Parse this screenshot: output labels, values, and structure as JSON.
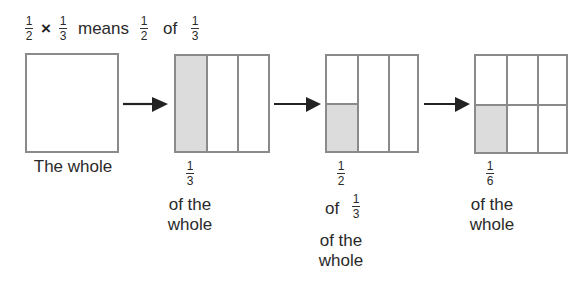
{
  "title": {
    "frac_a": {
      "num": "1",
      "den": "2"
    },
    "operator": "×",
    "frac_b": {
      "num": "1",
      "den": "3"
    },
    "word_means": "means",
    "frac_c": {
      "num": "1",
      "den": "2"
    },
    "word_of": "of",
    "frac_d": {
      "num": "1",
      "den": "3"
    }
  },
  "colors": {
    "border": "#8a8a8a",
    "shade": "#dcdcdc",
    "arrow": "#222222",
    "text": "#2a2a2a"
  },
  "panels": [
    {
      "id": "whole",
      "label_lines": [
        "The whole"
      ],
      "columns": 1,
      "rows": 1,
      "shaded": []
    },
    {
      "id": "one-third",
      "fraction": {
        "num": "1",
        "den": "3"
      },
      "label_lines": [
        "of the",
        "whole"
      ],
      "columns": 3,
      "rows": 1,
      "shaded": [
        "col1"
      ]
    },
    {
      "id": "half-of-third",
      "fraction": {
        "num": "1",
        "den": "2"
      },
      "of_text": "of",
      "inner_fraction": {
        "num": "1",
        "den": "3"
      },
      "label_lines": [
        "of the",
        "whole"
      ],
      "columns": 3,
      "rows": 2,
      "split_column": 1,
      "shaded": [
        "col1-bottom"
      ]
    },
    {
      "id": "one-sixth",
      "fraction": {
        "num": "1",
        "den": "6"
      },
      "label_lines": [
        "of the",
        "whole"
      ],
      "columns": 3,
      "rows": 2,
      "shaded": [
        "col1-bottom"
      ]
    }
  ],
  "arrows": [
    {
      "from": "whole",
      "to": "one-third"
    },
    {
      "from": "one-third",
      "to": "half-of-third"
    },
    {
      "from": "half-of-third",
      "to": "one-sixth"
    }
  ]
}
